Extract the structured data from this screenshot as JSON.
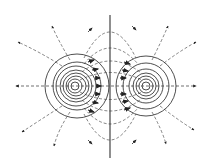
{
  "diagram": {
    "colors": {
      "line": "#333333",
      "background": "#ffffff"
    },
    "charges": [
      {
        "id": "left",
        "cx": 77,
        "cy": 86,
        "rings": [
          7,
          10,
          13,
          16,
          19,
          22,
          25,
          32
        ]
      },
      {
        "id": "right",
        "cx": 146,
        "cy": 86,
        "rings": [
          3,
          6,
          9,
          12,
          15,
          19,
          26
        ]
      }
    ],
    "symmetry_axis": {
      "x": 110,
      "y1": 15,
      "y2": 158
    }
  }
}
